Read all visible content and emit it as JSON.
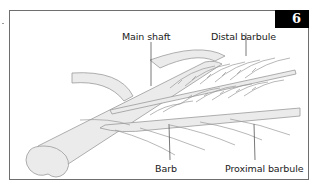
{
  "figure": {
    "number": "6",
    "labels": {
      "main_shaft": "Main shaft",
      "distal_barbule": "Distal barbule",
      "barb": "Barb",
      "proximal_barbule": "Proximal barbule"
    },
    "colors": {
      "fill": "#ebebeb",
      "stroke": "#9a9a9a",
      "badge_bg": "#000000",
      "badge_text": "#ffffff",
      "border": "#6e6e6e"
    }
  }
}
